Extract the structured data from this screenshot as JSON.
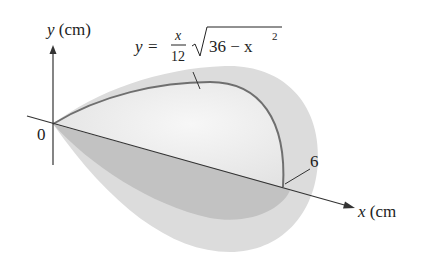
{
  "figure": {
    "type": "solid-of-revolution",
    "y_axis_label_var": "y",
    "y_axis_label_unit": "(cm)",
    "x_axis_label_var": "x",
    "x_axis_label_unit": "(cm",
    "origin_label": "0",
    "endpoint_label": "6",
    "equation": {
      "lhs": "y",
      "equals": "=",
      "frac_num": "x",
      "frac_den": "12",
      "radicand": "36 − x",
      "exponent": "2"
    },
    "colors": {
      "outer_surface": "#d9d9d9",
      "inner_surface": "#ececec",
      "lower_surface": "#bdbdbd",
      "curve": "#6f6f6f",
      "axis": "#333333"
    }
  }
}
